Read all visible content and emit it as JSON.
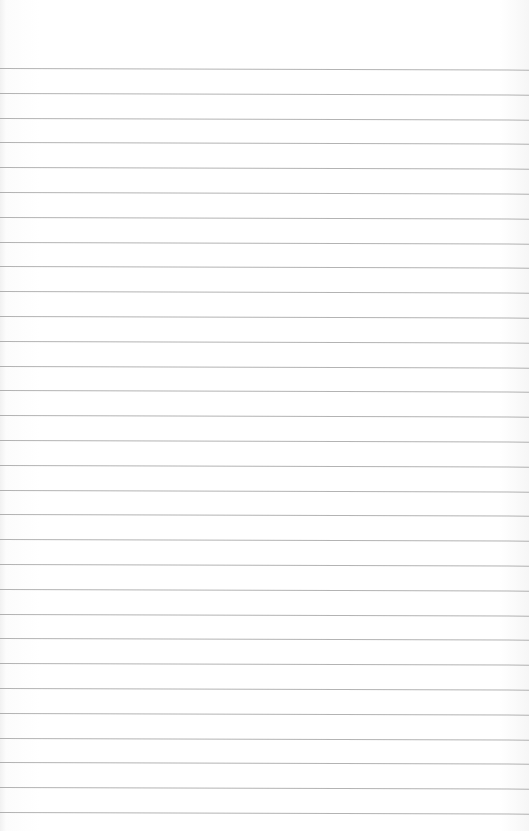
{
  "page": {
    "type": "lined-paper",
    "background_color": "#ffffff",
    "line_color": "#9a9a9a",
    "first_line_y": 68,
    "line_spacing": 24.8,
    "line_count": 31,
    "text_content": ""
  }
}
